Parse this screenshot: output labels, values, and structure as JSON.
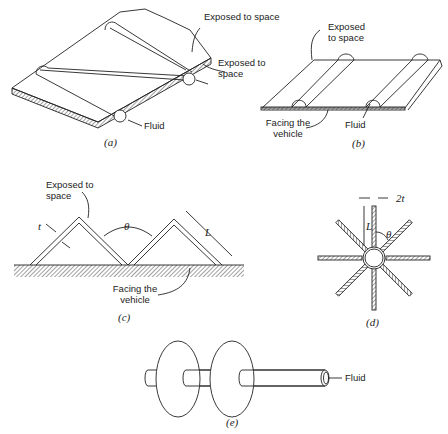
{
  "figure": {
    "panels": [
      {
        "id": "a",
        "caption": "(a)",
        "labels": {
          "exposed_top": "Exposed to space",
          "exposed_side": "Exposed to space",
          "fluid": "Fluid"
        }
      },
      {
        "id": "b",
        "caption": "(b)",
        "labels": {
          "exposed": "Exposed to space",
          "facing": "Facing the vehicle",
          "fluid": "Fluid"
        }
      },
      {
        "id": "c",
        "caption": "(c)",
        "labels": {
          "exposed": "Exposed to space",
          "facing": "Facing the vehicle",
          "t": "t",
          "theta": "θ",
          "L": "L"
        }
      },
      {
        "id": "d",
        "caption": "(d)",
        "labels": {
          "two_t": "2t",
          "L": "L",
          "theta": "θ"
        }
      },
      {
        "id": "e",
        "caption": "(e)",
        "labels": {
          "fluid": "Fluid"
        }
      }
    ]
  }
}
